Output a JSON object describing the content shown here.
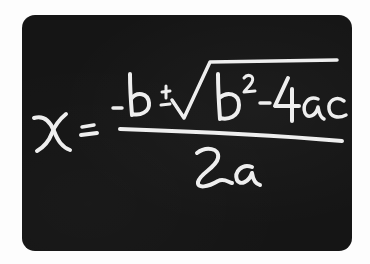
{
  "image": {
    "subject": "Quadratic formula handwritten in white chalk on a blackboard",
    "formula_text": "x = (-b ± √(b² - 4ac)) / 2a",
    "numerator_text": "-b ± √(b² - 4ac)",
    "denominator_text": "2a",
    "lhs_text": "x =",
    "colors": {
      "board": "#151515",
      "chalk": "#eeeeee",
      "background": "#fdfdfd"
    }
  }
}
